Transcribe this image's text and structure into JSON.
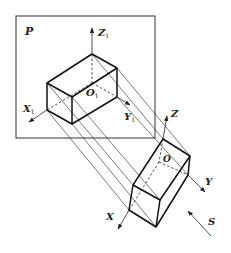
{
  "diagram": {
    "type": "parallel-projection",
    "plane_label": "P",
    "projected_axes": {
      "z": {
        "letter": "Z",
        "sub": "1"
      },
      "x": {
        "letter": "X",
        "sub": "1"
      },
      "y": {
        "letter": "Y",
        "sub": "1"
      },
      "origin": {
        "letter": "O",
        "sub": "1"
      }
    },
    "object_axes": {
      "z": "Z",
      "x": "X",
      "y": "Y",
      "origin": "O"
    },
    "projection_direction_label": "S",
    "colors": {
      "line": "#222222",
      "frame": "#333333",
      "background": "#ffffff"
    }
  }
}
